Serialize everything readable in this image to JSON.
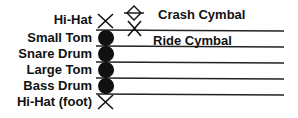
{
  "left_labels": [
    {
      "label": "Hi-Hat",
      "symbol": "x-notehead"
    },
    {
      "label": "Small Tom",
      "symbol": "filled-notehead"
    },
    {
      "label": "Snare Drum",
      "symbol": "filled-notehead"
    },
    {
      "label": "Large Tom",
      "symbol": "filled-notehead"
    },
    {
      "label": "Bass Drum",
      "symbol": "filled-notehead"
    },
    {
      "label": "Hi-Hat (foot)",
      "symbol": "x-notehead"
    }
  ],
  "right_labels": [
    {
      "label": "Crash Cymbal",
      "symbol": "diamond-x-notehead"
    },
    {
      "label": "Ride Cymbal",
      "symbol": "x-notehead"
    }
  ],
  "staff": {
    "line_count": 5,
    "color": "#222222"
  }
}
